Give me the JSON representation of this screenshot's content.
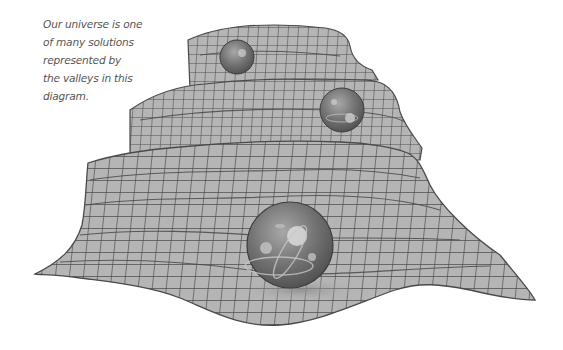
{
  "caption": {
    "lines": [
      "Our universe is one",
      "of many solutions",
      "represented by",
      "the valleys in this",
      "diagram."
    ]
  },
  "diagram": {
    "surface": {
      "fill": "#b5b5b5",
      "grid": "#4a4a4a"
    },
    "spheres": [
      {
        "name": "top-sphere",
        "cx": 237,
        "cy": 57,
        "r": 17
      },
      {
        "name": "middle-sphere",
        "cx": 342,
        "cy": 110,
        "r": 22
      },
      {
        "name": "front-sphere",
        "cx": 290,
        "cy": 245,
        "r": 43
      }
    ],
    "sphere_color": "#6e6e6e"
  }
}
